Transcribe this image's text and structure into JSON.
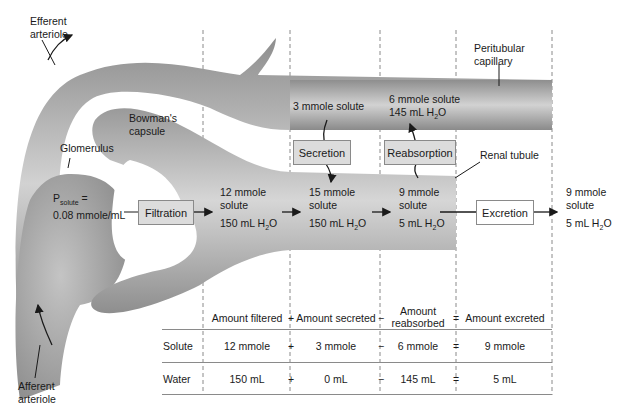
{
  "labels": {
    "efferent_arteriole": [
      "Efferent",
      "arteriole"
    ],
    "afferent_arteriole": [
      "Afferent",
      "arteriole"
    ],
    "bowmans_capsule": [
      "Bowman's",
      "capsule"
    ],
    "glomerulus": "Glomerulus",
    "peritubular_capillary": [
      "Peritubular",
      "capillary"
    ],
    "renal_tubule": "Renal tubule",
    "p_solute_main": "P",
    "p_solute_sub": "solute",
    "p_solute_eq": " =",
    "p_solute_value": "0.08 mmole/mL"
  },
  "process_boxes": {
    "filtration": "Filtration",
    "secretion": "Secretion",
    "reabsorption": "Reabsorption",
    "excretion": "Excretion"
  },
  "stages": {
    "filtered": {
      "solute": [
        "12 mmole",
        "solute"
      ],
      "water": "150 mL H",
      "water_sub": "2",
      "water_tail": "O"
    },
    "after_secretion": {
      "solute": [
        "15 mmole",
        "solute"
      ],
      "water": "150 mL H",
      "water_sub": "2",
      "water_tail": "O"
    },
    "after_reabsorption": {
      "solute": [
        "9 mmole",
        "solute"
      ],
      "water": "5 mL H",
      "water_sub": "2",
      "water_tail": "O"
    },
    "excreted": {
      "solute": [
        "9 mmole",
        "solute"
      ],
      "water": "5 mL H",
      "water_sub": "2",
      "water_tail": "O"
    },
    "secreted_from_capillary": "3 mmole solute",
    "reabsorbed_to_capillary": {
      "solute": "6 mmole solute",
      "water": "145 mL H",
      "water_sub": "2",
      "water_tail": "O"
    }
  },
  "table": {
    "headers": [
      "Amount filtered",
      "Amount secreted",
      "Amount reabsorbed",
      "Amount excreted"
    ],
    "header_reabsorbed_lines": [
      "Amount",
      "reabsorbed"
    ],
    "operators": [
      "+",
      "−",
      "="
    ],
    "rows": [
      {
        "label": "Solute",
        "values": [
          "12 mmole",
          "3 mmole",
          "6 mmole",
          "9 mmole"
        ]
      },
      {
        "label": "Water",
        "values": [
          "150 mL",
          "0 mL",
          "145 mL",
          "5 mL"
        ]
      }
    ]
  },
  "colors": {
    "vessel_dark": "#8c8c8c",
    "vessel_light": "#d4d4d4",
    "box_fill": "#dcdcdc",
    "line": "#8a8a8a"
  }
}
